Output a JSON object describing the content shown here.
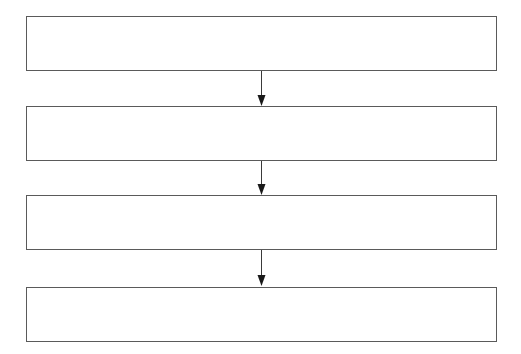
{
  "diagram": {
    "type": "vertical-flowchart",
    "boxes": [
      {
        "id": "step-1",
        "label": "",
        "top": 16
      },
      {
        "id": "step-2",
        "label": "",
        "top": 106
      },
      {
        "id": "step-3",
        "label": "",
        "top": 195
      },
      {
        "id": "step-4",
        "label": "",
        "top": 287
      }
    ],
    "connectors": [
      {
        "from": "step-1",
        "to": "step-2"
      },
      {
        "from": "step-2",
        "to": "step-3"
      },
      {
        "from": "step-3",
        "to": "step-4"
      }
    ],
    "colors": {
      "stroke": "#5a5a5a",
      "arrow": "#1a1a1a",
      "background": "#ffffff"
    }
  }
}
